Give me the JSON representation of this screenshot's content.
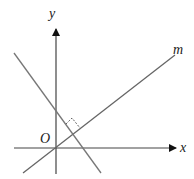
{
  "diagram": {
    "type": "coordinate-geometry",
    "labels": {
      "x_axis": "x",
      "y_axis": "y",
      "origin": "O",
      "line_m": "m"
    },
    "colors": {
      "axis": "#333333",
      "line": "#666666",
      "background": "#ffffff"
    },
    "elements": [
      "x-axis with arrow",
      "y-axis with arrow",
      "line m through origin with positive slope",
      "line perpendicular to m with negative slope",
      "right-angle marker at intersection"
    ]
  }
}
